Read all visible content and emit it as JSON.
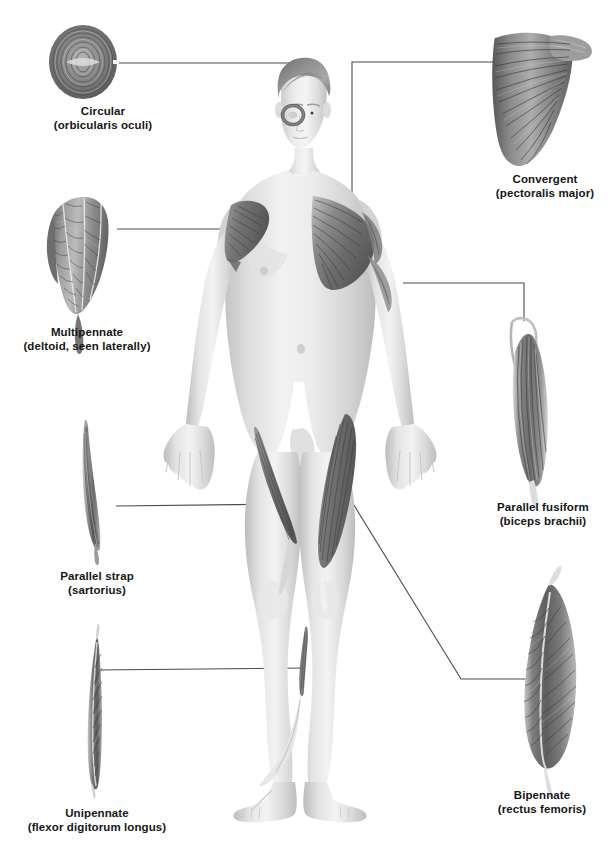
{
  "figure": {
    "background_color": "#ffffff",
    "line_color": "#4a4a4a",
    "text_color": "#161616",
    "muscle_dark": "#5e5e5e",
    "muscle_mid": "#8d8d8d",
    "muscle_light": "#c9c9c9",
    "skin_light": "#efefef",
    "skin_mid": "#d8d8d8",
    "skin_shadow": "#b9b9b9"
  },
  "labels": [
    {
      "id": "circular",
      "name": "Circular",
      "detail": "(orbicularis oculi)",
      "x": 103,
      "y": 104
    },
    {
      "id": "convergent",
      "name": "Convergent",
      "detail": "(pectoralis major)",
      "x": 545,
      "y": 172
    },
    {
      "id": "multipennate",
      "name": "Multipennate",
      "detail": "(deltoid, seen laterally)",
      "x": 87,
      "y": 325
    },
    {
      "id": "parallel-fusiform",
      "name": "Parallel fusiform",
      "detail": "(biceps brachii)",
      "x": 543,
      "y": 500
    },
    {
      "id": "parallel-strap",
      "name": "Parallel strap",
      "detail": "(sartorius)",
      "x": 97,
      "y": 569
    },
    {
      "id": "bipennate",
      "name": "Bipennate",
      "detail": "(rectus femoris)",
      "x": 542,
      "y": 788
    },
    {
      "id": "unipennate",
      "name": "Unipennate",
      "detail": "(flexor digitorum longus)",
      "x": 97,
      "y": 806
    }
  ],
  "muscle_specimens": [
    {
      "id": "circular-specimen",
      "shape": "circular-ring"
    },
    {
      "id": "convergent-specimen",
      "shape": "fan-convergent"
    },
    {
      "id": "multipennate-specimen",
      "shape": "multipennate-teardrop"
    },
    {
      "id": "parallel-fusiform-specimen",
      "shape": "fusiform-spindle"
    },
    {
      "id": "parallel-strap-specimen",
      "shape": "long-strap"
    },
    {
      "id": "bipennate-specimen",
      "shape": "bipennate-spindle"
    },
    {
      "id": "unipennate-specimen",
      "shape": "unipennate-sliver"
    }
  ],
  "body_figure": {
    "id": "human-body-anterior",
    "description": "Anterior view of male human figure with highlighted muscles"
  },
  "leader_lines": [
    {
      "id": "leader-circular",
      "from": "circular-specimen",
      "to": "orbicularis-oculi-on-body"
    },
    {
      "id": "leader-convergent",
      "from": "convergent-specimen",
      "to": "pectoralis-major-on-body"
    },
    {
      "id": "leader-multipennate",
      "from": "multipennate-specimen",
      "to": "deltoid-on-body"
    },
    {
      "id": "leader-parallel-fusiform",
      "from": "parallel-fusiform-specimen",
      "to": "biceps-brachii-on-body"
    },
    {
      "id": "leader-parallel-strap",
      "from": "parallel-strap-specimen",
      "to": "sartorius-on-body"
    },
    {
      "id": "leader-bipennate",
      "from": "bipennate-specimen",
      "to": "rectus-femoris-on-body"
    },
    {
      "id": "leader-unipennate",
      "from": "unipennate-specimen",
      "to": "flexor-digitorum-longus-on-body"
    }
  ]
}
